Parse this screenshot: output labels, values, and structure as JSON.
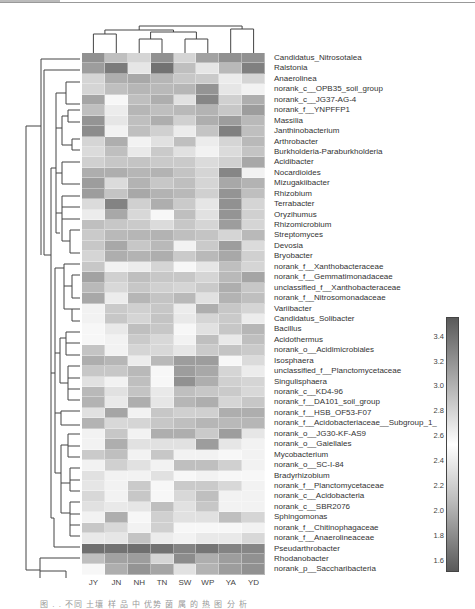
{
  "chart_data": {
    "type": "heatmap",
    "title": "",
    "columns": [
      "JY",
      "JN",
      "NH",
      "TN",
      "SW",
      "WP",
      "YA",
      "YD"
    ],
    "rows": [
      "Candidatus_Nitrosotalea",
      "Ralstonia",
      "Anaerolinea",
      "norank_c__OPB35_soil_group",
      "norank_c__JG37-AG-4",
      "norank_f__YNPFFP1",
      "Massilia",
      "Janthinobacterium",
      "Arthrobacter",
      "Burkholderia-Paraburkholderia",
      "Acidibacter",
      "Nocardioides",
      "Mizugakiibacter",
      "Rhizobium",
      "Terrabacter",
      "Oryzihumus",
      "Rhizomicrobium",
      "Streptomyces",
      "Devosia",
      "Bryobacter",
      "norank_f__Xanthobacteraceae",
      "norank_f__Gemmatimonadaceae",
      "unclassified_f__Xanthobacteraceae",
      "norank_f__Nitrosomonadaceae",
      "Variibacter",
      "Candidatus_Solibacter",
      "Bacillus",
      "Acidothermus",
      "norank_o__Acidimicrobiales",
      "Isosphaera",
      "unclassified_f__Planctomycetaceae",
      "Singulisphaera",
      "norank_c__KD4-96",
      "norank_f__DA101_soil_group",
      "norank_f__HSB_OF53-F07",
      "norank_f__Acidobacteriaceae__Subgroup_1_",
      "norank_o__JG30-KF-AS9",
      "norank_o__Gaiellales",
      "Mycobacterium",
      "norank_o__SC-I-84",
      "Bradyrhizobium",
      "norank_f__Planctomycetaceae",
      "norank_c__Acidobacteria",
      "norank_c__SBR2076",
      "Sphingomonas",
      "norank_f__Chitinophagaceae",
      "norank_f__Anaerolineaceae",
      "Pseudarthrobacter",
      "Rhodanobacter",
      "norank_p__Saccharibacteria"
    ],
    "intensity_note": "values are visual darkness estimates 0 (white) to 1 (darkest gray), read from grayscale cells",
    "values": [
      [
        0.62,
        0.35,
        0.22,
        0.62,
        0.22,
        0.52,
        0.62,
        0.62
      ],
      [
        0.55,
        0.75,
        0.12,
        0.8,
        0.35,
        0.12,
        0.38,
        0.72
      ],
      [
        0.22,
        0.45,
        0.48,
        0.4,
        0.3,
        0.28,
        0.08,
        0.22
      ],
      [
        0.22,
        0.35,
        0.4,
        0.38,
        0.4,
        0.6,
        0.12,
        0.05
      ],
      [
        0.5,
        0.02,
        0.35,
        0.45,
        0.15,
        0.68,
        0.25,
        0.45
      ],
      [
        0.35,
        0.08,
        0.4,
        0.35,
        0.38,
        0.42,
        0.3,
        0.55
      ],
      [
        0.6,
        0.12,
        0.35,
        0.45,
        0.25,
        0.45,
        0.55,
        0.38
      ],
      [
        0.65,
        0.05,
        0.35,
        0.25,
        0.08,
        0.32,
        0.72,
        0.35
      ],
      [
        0.22,
        0.45,
        0.05,
        0.15,
        0.35,
        0.08,
        0.22,
        0.38
      ],
      [
        0.18,
        0.35,
        0.1,
        0.28,
        0.15,
        0.05,
        0.18,
        0.32
      ],
      [
        0.25,
        0.3,
        0.32,
        0.28,
        0.28,
        0.18,
        0.25,
        0.48
      ],
      [
        0.45,
        0.45,
        0.4,
        0.42,
        0.32,
        0.22,
        0.68,
        0.05
      ],
      [
        0.55,
        0.18,
        0.42,
        0.3,
        0.35,
        0.22,
        0.48,
        0.42
      ],
      [
        0.55,
        0.32,
        0.48,
        0.42,
        0.38,
        0.25,
        0.6,
        0.35
      ],
      [
        0.18,
        0.7,
        0.25,
        0.45,
        0.28,
        0.12,
        0.62,
        0.22
      ],
      [
        0.08,
        0.48,
        0.2,
        0.02,
        0.35,
        0.15,
        0.6,
        0.25
      ],
      [
        0.35,
        0.3,
        0.28,
        0.18,
        0.3,
        0.22,
        0.55,
        0.22
      ],
      [
        0.28,
        0.38,
        0.4,
        0.42,
        0.35,
        0.32,
        0.22,
        0.38
      ],
      [
        0.3,
        0.48,
        0.3,
        0.38,
        0.05,
        0.28,
        0.55,
        0.18
      ],
      [
        0.22,
        0.45,
        0.42,
        0.45,
        0.28,
        0.38,
        0.48,
        0.25
      ],
      [
        0.3,
        0.05,
        0.08,
        0.22,
        0.02,
        0.12,
        0.35,
        0.22
      ],
      [
        0.52,
        0.25,
        0.35,
        0.3,
        0.3,
        0.22,
        0.38,
        0.5
      ],
      [
        0.38,
        0.2,
        0.3,
        0.25,
        0.22,
        0.28,
        0.45,
        0.3
      ],
      [
        0.48,
        0.08,
        0.4,
        0.32,
        0.38,
        0.15,
        0.42,
        0.35
      ],
      [
        0.05,
        0.28,
        0.25,
        0.3,
        0.08,
        0.45,
        0.3,
        0.22
      ],
      [
        0.05,
        0.3,
        0.22,
        0.32,
        0.1,
        0.22,
        0.28,
        0.08
      ],
      [
        0.02,
        0.1,
        0.35,
        0.3,
        0.02,
        0.15,
        0.3,
        0.4
      ],
      [
        0.02,
        0.05,
        0.28,
        0.2,
        0.05,
        0.35,
        0.1,
        0.35
      ],
      [
        0.32,
        0.05,
        0.22,
        0.2,
        0.12,
        0.28,
        0.32,
        0.28
      ],
      [
        0.45,
        0.4,
        0.08,
        0.38,
        0.55,
        0.55,
        0.02,
        0.18
      ],
      [
        0.3,
        0.3,
        0.38,
        0.02,
        0.55,
        0.48,
        0.22,
        0.08
      ],
      [
        0.15,
        0.05,
        0.35,
        0.02,
        0.62,
        0.45,
        0.25,
        0.22
      ],
      [
        0.38,
        0.15,
        0.32,
        0.1,
        0.35,
        0.3,
        0.28,
        0.2
      ],
      [
        0.42,
        0.1,
        0.45,
        0.12,
        0.4,
        0.45,
        0.22,
        0.3
      ],
      [
        0.15,
        0.5,
        0.05,
        0.3,
        0.25,
        0.25,
        0.45,
        0.45
      ],
      [
        0.42,
        0.2,
        0.22,
        0.3,
        0.35,
        0.4,
        0.38,
        0.4
      ],
      [
        0.05,
        0.3,
        0.05,
        0.45,
        0.45,
        0.28,
        0.55,
        0.12
      ],
      [
        0.05,
        0.45,
        0.15,
        0.15,
        0.15,
        0.55,
        0.12,
        0.05
      ],
      [
        0.28,
        0.35,
        0.05,
        0.3,
        0.05,
        0.05,
        0.02,
        0.05
      ],
      [
        0.05,
        0.25,
        0.15,
        0.05,
        0.35,
        0.35,
        0.25,
        0.05
      ],
      [
        0.15,
        0.05,
        0.05,
        0.15,
        0.02,
        0.05,
        0.02,
        0.02
      ],
      [
        0.12,
        0.05,
        0.28,
        0.02,
        0.28,
        0.28,
        0.2,
        0.05
      ],
      [
        0.2,
        0.05,
        0.3,
        0.02,
        0.2,
        0.35,
        0.05,
        0.05
      ],
      [
        0.15,
        0.1,
        0.12,
        0.35,
        0.15,
        0.3,
        0.05,
        0.05
      ],
      [
        0.05,
        0.45,
        0.02,
        0.25,
        0.15,
        0.15,
        0.35,
        0.22
      ],
      [
        0.3,
        0.2,
        0.05,
        0.25,
        0.02,
        0.02,
        0.02,
        0.05
      ],
      [
        0.1,
        0.12,
        0.32,
        0.08,
        0.05,
        0.1,
        0.1,
        0.2
      ],
      [
        0.82,
        0.8,
        0.82,
        0.8,
        0.7,
        0.78,
        0.7,
        0.68
      ],
      [
        0.35,
        0.52,
        0.55,
        0.22,
        0.65,
        0.45,
        0.55,
        0.62
      ],
      [
        0.02,
        0.45,
        0.6,
        0.5,
        0.15,
        0.42,
        0.55,
        0.62
      ]
    ],
    "colorbar": {
      "ticks": [
        3.4,
        3.2,
        3.0,
        2.8,
        2.6,
        2.4,
        2.2,
        2.0,
        1.8,
        1.6
      ],
      "range": [
        1.5,
        3.55
      ],
      "colors": {
        "high": "#5a5a5a",
        "mid": "#ffffff",
        "low": "#5a5a5a"
      }
    },
    "dendrogram": {
      "rows": "hierarchical clustering",
      "columns": "hierarchical clustering"
    },
    "legend_position": "right"
  },
  "caption": "图 . . 不同 土壤 样 品 中 优势 菌 属 的 热 图 分 析"
}
